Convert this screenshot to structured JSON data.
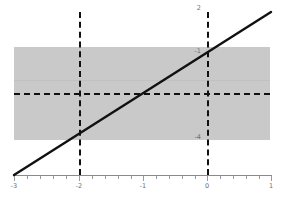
{
  "chart_data": {
    "type": "line",
    "title": "",
    "subtitle": "",
    "xlabel": "",
    "ylabel": "",
    "xlim": [
      -3,
      1
    ],
    "ylim": [
      -5,
      2
    ],
    "grid": false,
    "legend": null,
    "series": [
      {
        "name": "y = x + 1",
        "type": "line",
        "style": "solid",
        "color": "#111111",
        "x": [
          -3,
          1
        ],
        "y": [
          -5,
          2
        ]
      }
    ],
    "x_ticks": [
      -3,
      -2,
      -1,
      0,
      1
    ],
    "x_tick_labels": [
      "-3",
      "-2",
      "-1",
      "0",
      "1"
    ],
    "y_ticks": [
      2,
      -1,
      -4
    ],
    "y_tick_labels": [
      "2",
      "-1",
      "-4"
    ],
    "annotations": {
      "shaded_band": {
        "name": "horizontal-shaded-band",
        "y_from": -4,
        "y_to": 1,
        "x_from": -3,
        "x_to": 1,
        "color": "#c9c9c9"
      },
      "vertical_dashed_lines": [
        {
          "name": "vline-x-minus-2",
          "x": -2,
          "color": "#101010"
        },
        {
          "name": "vline-x-0",
          "x": 0,
          "color": "#101010"
        }
      ],
      "horizontal_dashed_lines": [
        {
          "name": "hline-y-minus-1",
          "y": -1,
          "color": "#101010"
        }
      ]
    }
  },
  "labels": {
    "x": {
      "x_m3": "-3",
      "x_m2": "-2",
      "x_m1": "-1",
      "x_0": "0",
      "x_1": "1"
    },
    "y": {
      "y_top": "2",
      "y_mid": "-1",
      "y_low": "-4"
    }
  }
}
